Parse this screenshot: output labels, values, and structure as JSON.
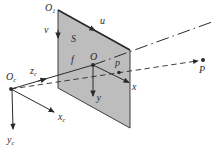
{
  "figure": {
    "description_name": "pinhole-camera-projection-diagram"
  },
  "colors": {
    "line": "#2b2b2b",
    "plane_fill": "#bdbdbd",
    "background": "#ffffff"
  },
  "labels": {
    "image_origin": {
      "main": "O",
      "sub": "1"
    },
    "u_axis": "u",
    "v_axis": "v",
    "plane": "S",
    "focal_length": "f",
    "principal_point": "O",
    "x_axis": "x",
    "y_axis": "y",
    "image_point": "p",
    "scene_point": "P",
    "camera_origin": {
      "main": "O",
      "sub": "c"
    },
    "zc_axis": {
      "main": "z",
      "sub": "c"
    },
    "xc_axis": {
      "main": "x",
      "sub": "c"
    },
    "yc_axis": {
      "main": "y",
      "sub": "c"
    }
  }
}
